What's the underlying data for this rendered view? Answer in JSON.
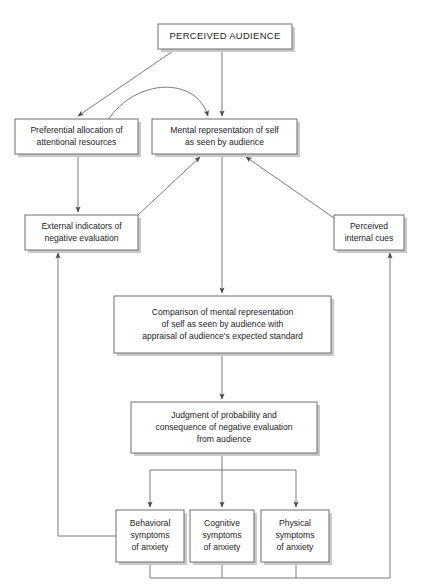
{
  "diagram": {
    "style": {
      "box_fill": "#ffffff",
      "box_stroke": "#6e6e6e",
      "shadow": "#c9c9c9",
      "edge_stroke": "#7a7a7a",
      "text_color": "#1d1d1d",
      "background": "#ffffff"
    },
    "nodes": [
      {
        "id": "perceived-audience",
        "name": "perceived-audience",
        "lines": [
          "PERCEIVED AUDIENCE"
        ],
        "x": 158,
        "y": 24,
        "w": 134,
        "h": 25,
        "emphasis": "title"
      },
      {
        "id": "preferential-allocation",
        "name": "preferential-allocation",
        "lines": [
          "Preferential allocation of",
          "attentional resources"
        ],
        "x": 15,
        "y": 119,
        "w": 123,
        "h": 35,
        "emphasis": "normal"
      },
      {
        "id": "mental-representation",
        "name": "mental-representation",
        "lines": [
          "Mental representation of self",
          "as seen by audience"
        ],
        "x": 152,
        "y": 119,
        "w": 145,
        "h": 35,
        "emphasis": "normal"
      },
      {
        "id": "external-indicators",
        "name": "external-indicators",
        "lines": [
          "External indicators of",
          "negative evaluation"
        ],
        "x": 25,
        "y": 215,
        "w": 113,
        "h": 35,
        "emphasis": "normal"
      },
      {
        "id": "perceived-internal-cues",
        "name": "perceived-internal-cues",
        "lines": [
          "Perceived",
          "internal cues"
        ],
        "x": 334,
        "y": 215,
        "w": 70,
        "h": 35,
        "emphasis": "normal"
      },
      {
        "id": "comparison",
        "name": "comparison",
        "lines": [
          "Comparison of mental representation",
          "of self as seen by audience with",
          "appraisal of audience's expected standard"
        ],
        "x": 114,
        "y": 296,
        "w": 217,
        "h": 57,
        "emphasis": "normal"
      },
      {
        "id": "judgment",
        "name": "judgment",
        "lines": [
          "Judgment of probability and",
          "consequence of negative evaluation",
          "from audience"
        ],
        "x": 131,
        "y": 402,
        "w": 186,
        "h": 51,
        "emphasis": "normal"
      },
      {
        "id": "behavioral-symptoms",
        "name": "behavioral-symptoms",
        "lines": [
          "Behavioral",
          "symptoms",
          "of anxiety"
        ],
        "x": 116,
        "y": 510,
        "w": 68,
        "h": 52,
        "emphasis": "normal"
      },
      {
        "id": "cognitive-symptoms",
        "name": "cognitive-symptoms",
        "lines": [
          "Cognitive",
          "symptoms",
          "of anxiety"
        ],
        "x": 190,
        "y": 510,
        "w": 64,
        "h": 52,
        "emphasis": "normal"
      },
      {
        "id": "physical-symptoms",
        "name": "physical-symptoms",
        "lines": [
          "Physical",
          "symptoms",
          "of anxiety"
        ],
        "x": 261,
        "y": 510,
        "w": 68,
        "h": 52,
        "emphasis": "normal"
      }
    ],
    "edges": [
      {
        "id": "audience-to-preferential",
        "name": "edge-audience-to-preferential",
        "path": "M 176 49 L 78 116",
        "arrow": true
      },
      {
        "id": "audience-to-mental",
        "name": "edge-audience-to-mental",
        "path": "M 222 49 L 222 116",
        "arrow": true
      },
      {
        "id": "preferential-curve-to-mental",
        "name": "edge-preferential-to-mental",
        "path": "M 108 120 C 136 78, 196 76, 208 116",
        "arrow": true
      },
      {
        "id": "preferential-to-external",
        "name": "edge-preferential-to-external",
        "path": "M 78 154 L 78 212",
        "arrow": true
      },
      {
        "id": "external-to-mental",
        "name": "edge-external-to-mental",
        "path": "M 138 215 L 200 157",
        "arrow": true
      },
      {
        "id": "internal-cues-to-mental",
        "name": "edge-internal-cues-to-mental",
        "path": "M 334 218 L 246 157",
        "arrow": true
      },
      {
        "id": "mental-to-comparison",
        "name": "edge-mental-to-comparison",
        "path": "M 222 154 L 222 293",
        "arrow": true
      },
      {
        "id": "comparison-to-judgment",
        "name": "edge-comparison-to-judgment",
        "path": "M 222 353 L 222 399",
        "arrow": true
      },
      {
        "id": "judgment-bus",
        "name": "edge-judgment-bus",
        "path": "M 222 453 L 222 470 M 150 470 L 296 470",
        "arrow": false
      },
      {
        "id": "bus-to-behavioral",
        "name": "edge-bus-to-behavioral",
        "path": "M 150 470 L 150 507",
        "arrow": true
      },
      {
        "id": "bus-to-cognitive",
        "name": "edge-bus-to-cognitive",
        "path": "M 222 470 L 222 507",
        "arrow": true
      },
      {
        "id": "bus-to-physical",
        "name": "edge-bus-to-physical",
        "path": "M 296 470 L 296 507",
        "arrow": true
      },
      {
        "id": "behavioral-feedback-left",
        "name": "edge-behavioral-to-external-indicators",
        "path": "M 116 536 L 58 536 L 58 253",
        "arrow": true
      },
      {
        "id": "symptoms-bottom-bus",
        "name": "edge-symptoms-bottom-bus",
        "path": "M 150 562 L 150 578 M 222 562 L 222 578 M 296 562 L 296 578 M 150 578 L 390 578",
        "arrow": false
      },
      {
        "id": "bottom-feedback-right",
        "name": "edge-symptoms-to-internal-cues",
        "path": "M 390 578 L 390 253",
        "arrow": true
      }
    ]
  }
}
